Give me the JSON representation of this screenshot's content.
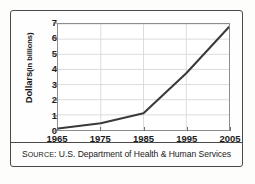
{
  "chart_data": {
    "type": "line",
    "title": "",
    "subtitle": "",
    "xlabel": "",
    "ylabel": "Dollars (in billions)",
    "ylabel_main": "Dollars",
    "ylabel_sub": "(in billions)",
    "x": [
      1965,
      1975,
      1985,
      1995,
      2005
    ],
    "values": [
      0.1,
      0.45,
      1.1,
      3.75,
      6.8
    ],
    "series": [
      {
        "name": "Dollars (in billions)",
        "values": [
          0.1,
          0.45,
          1.1,
          3.75,
          6.8
        ]
      }
    ],
    "categories": [
      "1965",
      "1975",
      "1985",
      "1995",
      "2005"
    ],
    "xlim": [
      1965,
      2005
    ],
    "ylim": [
      0,
      7
    ],
    "y_ticks": [
      0,
      1,
      2,
      3,
      4,
      5,
      6,
      7
    ],
    "y_tick_labels": [
      "0",
      "1",
      "2",
      "3",
      "4",
      "5",
      "6",
      "7"
    ],
    "x_ticks": [
      1965,
      1975,
      1985,
      1995,
      2005
    ],
    "x_tick_labels": [
      "1965",
      "1975",
      "1985",
      "1995",
      "2005"
    ],
    "grid": true,
    "grid_color": "#dcdcdc",
    "legend": false,
    "legend_position": "none",
    "line_color": "#3b3a38",
    "line_width": 2.1,
    "plot_border_color": "#8d8d8d",
    "frame_border_color": "#4a4a4a",
    "background_color": "#fefefe",
    "text_color": "#1b1b1b",
    "annotations": []
  },
  "footer": {
    "source_prefix": "S",
    "source_prefix_rest": "OURCE",
    "source_label": "SOURCE:",
    "source_body": "U.S. Department of Health & Human Services",
    "source_full": "SOURCE: U.S. Department of Health & Human Services"
  }
}
